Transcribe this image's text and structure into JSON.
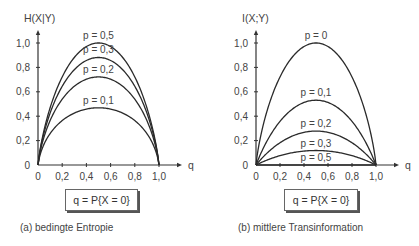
{
  "chart_data": [
    {
      "type": "line",
      "panel": "a",
      "title": "",
      "ylabel": "H(X|Y)",
      "xlabel": "q",
      "xlim": [
        0,
        1.0
      ],
      "ylim": [
        0,
        1.0
      ],
      "x_ticks": [
        "0",
        "0,2",
        "0,4",
        "0,6",
        "0,8",
        "1,0"
      ],
      "y_ticks": [
        "0",
        "0,2",
        "0,4",
        "0,6",
        "0,8",
        "1,0"
      ],
      "grid": false,
      "x_definition": "q = P{X = 0}",
      "caption": "(a) bedingte Entropie",
      "series": [
        {
          "name": "p = 0,5",
          "p": 0.5,
          "peak": 1.0
        },
        {
          "name": "p = 0,3",
          "p": 0.3,
          "peak": 0.88
        },
        {
          "name": "p = 0,2",
          "p": 0.2,
          "peak": 0.72
        },
        {
          "name": "p = 0,1",
          "p": 0.1,
          "peak": 0.47
        }
      ]
    },
    {
      "type": "line",
      "panel": "b",
      "title": "",
      "ylabel": "I(X;Y)",
      "xlabel": "q",
      "xlim": [
        0,
        1.0
      ],
      "ylim": [
        0,
        1.0
      ],
      "x_ticks": [
        "0",
        "0,2",
        "0,4",
        "0,6",
        "0,8",
        "1,0"
      ],
      "y_ticks": [
        "0",
        "0,2",
        "0,4",
        "0,6",
        "0,8",
        "1,0"
      ],
      "grid": false,
      "x_definition": "q = P{X = 0}",
      "caption": "(b) mittlere Transinformation",
      "series": [
        {
          "name": "p = 0",
          "p": 0.0,
          "peak": 1.0
        },
        {
          "name": "p = 0,1",
          "p": 0.1,
          "peak": 0.53
        },
        {
          "name": "p = 0,2",
          "p": 0.2,
          "peak": 0.28
        },
        {
          "name": "p = 0,3",
          "p": 0.3,
          "peak": 0.12
        },
        {
          "name": "p = 0,5",
          "p": 0.5,
          "peak": 0.0
        }
      ]
    }
  ],
  "panels": {
    "a": {
      "ylabel": "H(X|Y)",
      "xlabel": "q",
      "box_label": "q = P{X = 0}",
      "caption": "(a) bedingte Entropie",
      "curve_labels": [
        "p = 0,5",
        "p = 0,3",
        "p = 0,2",
        "p = 0,1"
      ]
    },
    "b": {
      "ylabel": "I(X;Y)",
      "xlabel": "q",
      "box_label": "q = P{X = 0}",
      "caption": "(b) mittlere Transinformation",
      "curve_labels": [
        "p = 0",
        "p = 0,1",
        "p = 0,2",
        "p = 0,3",
        "p = 0,5"
      ]
    }
  },
  "ticks": [
    "0",
    "0,2",
    "0,4",
    "0,6",
    "0,8",
    "1,0"
  ],
  "colors": {
    "line": "#2a2a2a",
    "axis": "#333333",
    "text": "#444444"
  }
}
